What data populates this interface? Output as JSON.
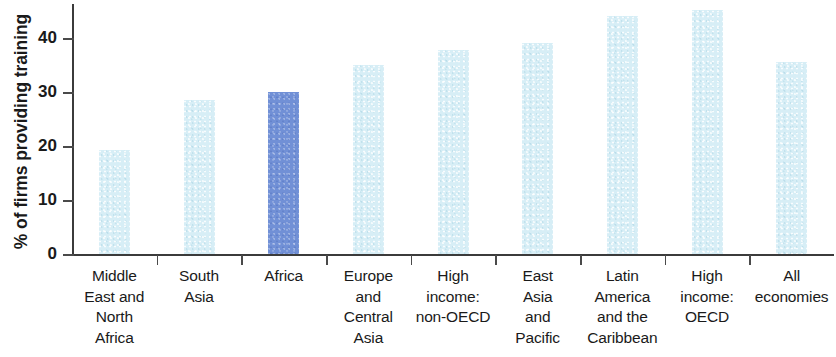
{
  "chart_data": {
    "type": "bar",
    "title": "",
    "subtitle": "",
    "xlabel": "",
    "ylabel": "% of firms providing training",
    "ylim": [
      0,
      46
    ],
    "yticks": [
      0,
      10,
      20,
      30,
      40
    ],
    "ytick_labels": [
      "0",
      "10",
      "20",
      "30",
      "40"
    ],
    "grid": false,
    "legend": null,
    "categories": [
      "Middle East and North Africa",
      "South Asia",
      "Africa",
      "Europe and Central Asia",
      "High income: non-OECD",
      "East Asia and Pacific",
      "Latin America and the Caribbean",
      "High income: OECD",
      "All economies"
    ],
    "category_lines": [
      [
        "Middle",
        "East and",
        "North",
        "Africa"
      ],
      [
        "South",
        "Asia"
      ],
      [
        "Africa"
      ],
      [
        "Europe",
        "and",
        "Central",
        "Asia"
      ],
      [
        "High",
        "income:",
        "non-OECD"
      ],
      [
        "East",
        "Asia",
        "and",
        "Pacific"
      ],
      [
        "Latin",
        "America",
        "and the",
        "Caribbean"
      ],
      [
        "High",
        "income:",
        "OECD"
      ],
      [
        "All",
        "economies"
      ]
    ],
    "values": [
      19.3,
      28.6,
      30.0,
      35.0,
      37.8,
      39.0,
      44.0,
      45.2,
      35.5
    ],
    "highlight_index": 2,
    "colors": {
      "bar_default": "#d7eef6",
      "bar_highlight": "#7190d6",
      "axis": "#3b3b3b",
      "text": "#1a1a1a",
      "background": "#ffffff"
    }
  }
}
